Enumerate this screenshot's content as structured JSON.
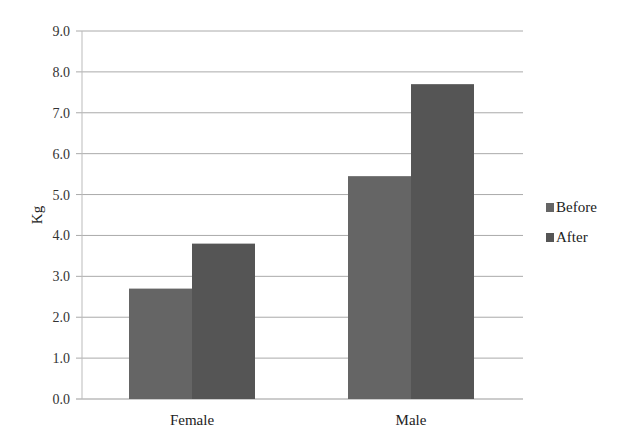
{
  "chart_data": {
    "type": "bar",
    "title": "",
    "xlabel": "",
    "ylabel": "Kg",
    "ylim": [
      0,
      9
    ],
    "yticks": [
      "0.0",
      "1.0",
      "2.0",
      "3.0",
      "4.0",
      "5.0",
      "6.0",
      "7.0",
      "8.0",
      "9.0"
    ],
    "grid": true,
    "legend_position": "right",
    "categories": [
      "Female",
      "Male"
    ],
    "series": [
      {
        "name": "Before",
        "values": [
          2.7,
          5.45
        ],
        "color": "#656565"
      },
      {
        "name": "After",
        "values": [
          3.8,
          7.7
        ],
        "color": "#555555"
      }
    ]
  }
}
